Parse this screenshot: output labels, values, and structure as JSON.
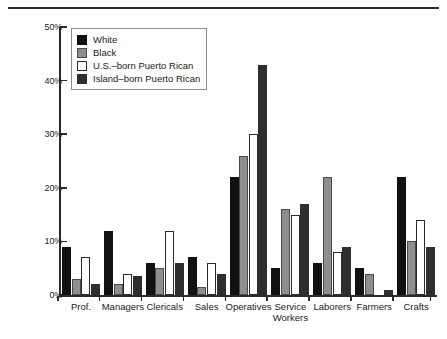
{
  "chart_data": {
    "type": "bar",
    "title": "",
    "xlabel": "",
    "ylabel": "",
    "ylim": [
      0,
      50
    ],
    "ytick_values": [
      0,
      10,
      20,
      30,
      40,
      50
    ],
    "ytick_labels": [
      "0%",
      "10%",
      "20%",
      "30%",
      "40%",
      "50%"
    ],
    "grid": false,
    "legend_position": "upper-left-inside",
    "categories": [
      "Prof.",
      "Managers",
      "Clericals",
      "Sales",
      "Operatives",
      "Service\nWorkers",
      "Laborers",
      "Farmers",
      "Crafts"
    ],
    "series": [
      {
        "name": "White",
        "color": "#111111",
        "values": [
          9,
          12,
          6,
          7,
          22,
          5,
          6,
          5,
          22
        ]
      },
      {
        "name": "Black",
        "color": "#8e8e8e",
        "values": [
          3,
          2,
          5,
          1.5,
          26,
          16,
          22,
          4,
          10
        ]
      },
      {
        "name": "U.S.-born Puerto Rican",
        "color": "#ffffff",
        "values": [
          7,
          4,
          12,
          6,
          30,
          15,
          8,
          0,
          14
        ]
      },
      {
        "name": "Island-born Puerto Rican",
        "color": "#2e2e2e",
        "values": [
          2,
          3.5,
          6,
          4,
          43,
          17,
          9,
          1,
          9
        ]
      }
    ]
  },
  "legend": {
    "items": [
      {
        "label": "White"
      },
      {
        "label": "Black"
      },
      {
        "label": "U.S.–born Puerto Rican"
      },
      {
        "label": "Island–born Puerto Rican"
      }
    ]
  }
}
